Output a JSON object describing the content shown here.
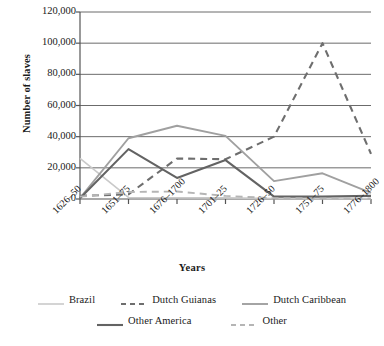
{
  "chart_data": {
    "type": "line",
    "title": "",
    "subtitle": "",
    "xlabel": "Years",
    "ylabel": "Number of slaves",
    "categories": [
      "1626–50",
      "1651–75",
      "1676–1700",
      "1701–25",
      "1726–50",
      "1751–75",
      "1776–1800"
    ],
    "ylim": [
      0,
      120000
    ],
    "ytick_labels": [
      "0",
      "20,000",
      "40,000",
      "60,000",
      "80,000",
      "100,000",
      "120,000"
    ],
    "ytick_values": [
      0,
      20000,
      40000,
      60000,
      80000,
      100000,
      120000
    ],
    "grid": "horizontal",
    "legend_position": "bottom",
    "series": [
      {
        "name": "Brazil",
        "color": "#c9c9c9",
        "style": "solid",
        "width": 1.6,
        "values": [
          26000,
          1000,
          800,
          700,
          300,
          200,
          200
        ]
      },
      {
        "name": "Dutch Guianas",
        "color": "#6e6e6e",
        "style": "dashed",
        "width": 2.1,
        "values": [
          2000,
          3000,
          26000,
          25500,
          40000,
          100000,
          29000
        ]
      },
      {
        "name": "Dutch Caribbean",
        "color": "#a0a0a0",
        "style": "solid",
        "width": 1.9,
        "values": [
          500,
          39000,
          47000,
          40500,
          11500,
          16500,
          4000
        ]
      },
      {
        "name": "Other America",
        "color": "#636363",
        "style": "solid",
        "width": 2.1,
        "values": [
          500,
          32000,
          13500,
          25000,
          1500,
          1500,
          2000
        ]
      },
      {
        "name": "Other",
        "color": "#b5b5b5",
        "style": "dashed",
        "width": 1.9,
        "values": [
          1500,
          4500,
          4800,
          2000,
          500,
          400,
          300
        ]
      }
    ]
  },
  "axes": {
    "y_title": "Number of slaves",
    "x_title": "Years"
  },
  "colors": {
    "axis": "#555555",
    "grid": "#6b6b6b",
    "text": "#1a1a1a",
    "background": "#ffffff"
  }
}
